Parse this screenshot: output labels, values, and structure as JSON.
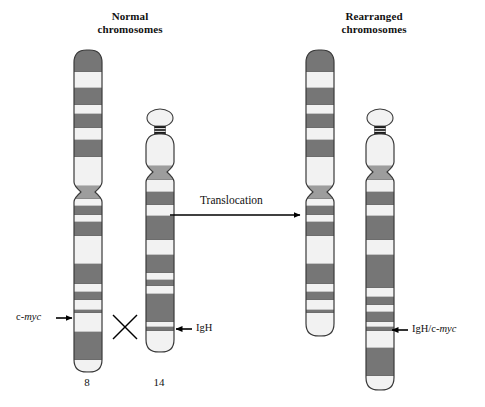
{
  "figure": {
    "kind": "chromosome-translocation-diagram",
    "background": "#ffffff",
    "width": 485,
    "height": 407
  },
  "titles": {
    "normal": "Normal\nchromosomes",
    "rearranged": "Rearranged\nchromosomes"
  },
  "process": {
    "arrow_label": "Translocation",
    "crossing_marker": "X"
  },
  "numbers": {
    "chr8": "8",
    "chr14": "14"
  },
  "labels": {
    "cmyc": {
      "prefix": "c-",
      "italic": "myc",
      "suffix": ""
    },
    "igh": {
      "prefix": "IgH",
      "italic": "",
      "suffix": ""
    },
    "igh_cmyc": {
      "prefix": "IgH/c-",
      "italic": "myc",
      "suffix": ""
    }
  },
  "colors": {
    "band_dark": "#767676",
    "band_mid": "#9d9d9d",
    "band_light": "#f2f2f2",
    "band_black": "#1a1a1a",
    "outline": "#3a3a3a",
    "text": "#111111",
    "arrow": "#000000",
    "background": "#ffffff"
  },
  "chromosomes": [
    {
      "id": "normal-chr8",
      "name": "normal chromosome 8",
      "group": "normal",
      "number": "8",
      "x": 74,
      "width": 28,
      "top": 50,
      "bottom": 372,
      "centromere_y": 192,
      "centromere_pinch": 7,
      "bands": [
        {
          "y0": 50,
          "y1": 72,
          "tone": "dark"
        },
        {
          "y0": 72,
          "y1": 88,
          "tone": "light"
        },
        {
          "y0": 88,
          "y1": 105,
          "tone": "dark"
        },
        {
          "y0": 105,
          "y1": 114,
          "tone": "light"
        },
        {
          "y0": 114,
          "y1": 128,
          "tone": "dark"
        },
        {
          "y0": 128,
          "y1": 140,
          "tone": "light"
        },
        {
          "y0": 140,
          "y1": 157,
          "tone": "dark"
        },
        {
          "y0": 157,
          "y1": 186,
          "tone": "light"
        },
        {
          "y0": 186,
          "y1": 199,
          "tone": "mid"
        },
        {
          "y0": 199,
          "y1": 206,
          "tone": "light"
        },
        {
          "y0": 206,
          "y1": 215,
          "tone": "dark"
        },
        {
          "y0": 215,
          "y1": 222,
          "tone": "light"
        },
        {
          "y0": 222,
          "y1": 236,
          "tone": "dark"
        },
        {
          "y0": 236,
          "y1": 264,
          "tone": "light"
        },
        {
          "y0": 264,
          "y1": 284,
          "tone": "dark"
        },
        {
          "y0": 284,
          "y1": 292,
          "tone": "light"
        },
        {
          "y0": 292,
          "y1": 300,
          "tone": "dark"
        },
        {
          "y0": 300,
          "y1": 310,
          "tone": "light"
        },
        {
          "y0": 310,
          "y1": 313,
          "tone": "dark"
        },
        {
          "y0": 313,
          "y1": 332,
          "tone": "light"
        },
        {
          "y0": 332,
          "y1": 360,
          "tone": "dark"
        },
        {
          "y0": 360,
          "y1": 372,
          "tone": "light"
        }
      ]
    },
    {
      "id": "normal-chr14",
      "name": "normal chromosome 14",
      "group": "normal",
      "number": "14",
      "x": 146,
      "width": 28,
      "top": 134,
      "bottom": 352,
      "satellite": {
        "cy": 118,
        "rx": 13,
        "ry": 9
      },
      "stalk": {
        "y0": 126,
        "y1": 134
      },
      "centromere_y": 172,
      "centromere_pinch": 7,
      "bands": [
        {
          "y0": 134,
          "y1": 166,
          "tone": "light"
        },
        {
          "y0": 166,
          "y1": 180,
          "tone": "mid"
        },
        {
          "y0": 180,
          "y1": 192,
          "tone": "light"
        },
        {
          "y0": 192,
          "y1": 205,
          "tone": "dark"
        },
        {
          "y0": 205,
          "y1": 216,
          "tone": "light"
        },
        {
          "y0": 216,
          "y1": 240,
          "tone": "dark"
        },
        {
          "y0": 240,
          "y1": 255,
          "tone": "light"
        },
        {
          "y0": 255,
          "y1": 273,
          "tone": "dark"
        },
        {
          "y0": 273,
          "y1": 280,
          "tone": "light"
        },
        {
          "y0": 280,
          "y1": 286,
          "tone": "dark"
        },
        {
          "y0": 286,
          "y1": 294,
          "tone": "light"
        },
        {
          "y0": 294,
          "y1": 322,
          "tone": "dark"
        },
        {
          "y0": 322,
          "y1": 327,
          "tone": "light"
        },
        {
          "y0": 327,
          "y1": 331,
          "tone": "dark"
        },
        {
          "y0": 331,
          "y1": 352,
          "tone": "light"
        }
      ]
    },
    {
      "id": "rearranged-chr8",
      "name": "rearranged chromosome 8",
      "group": "rearranged",
      "number": "",
      "x": 306,
      "width": 28,
      "top": 50,
      "bottom": 336,
      "centromere_y": 192,
      "centromere_pinch": 7,
      "bands": [
        {
          "y0": 50,
          "y1": 72,
          "tone": "dark"
        },
        {
          "y0": 72,
          "y1": 88,
          "tone": "light"
        },
        {
          "y0": 88,
          "y1": 105,
          "tone": "dark"
        },
        {
          "y0": 105,
          "y1": 114,
          "tone": "light"
        },
        {
          "y0": 114,
          "y1": 128,
          "tone": "dark"
        },
        {
          "y0": 128,
          "y1": 140,
          "tone": "light"
        },
        {
          "y0": 140,
          "y1": 157,
          "tone": "dark"
        },
        {
          "y0": 157,
          "y1": 186,
          "tone": "light"
        },
        {
          "y0": 186,
          "y1": 199,
          "tone": "mid"
        },
        {
          "y0": 199,
          "y1": 206,
          "tone": "light"
        },
        {
          "y0": 206,
          "y1": 215,
          "tone": "dark"
        },
        {
          "y0": 215,
          "y1": 222,
          "tone": "light"
        },
        {
          "y0": 222,
          "y1": 236,
          "tone": "dark"
        },
        {
          "y0": 236,
          "y1": 264,
          "tone": "light"
        },
        {
          "y0": 264,
          "y1": 284,
          "tone": "dark"
        },
        {
          "y0": 284,
          "y1": 292,
          "tone": "light"
        },
        {
          "y0": 292,
          "y1": 300,
          "tone": "dark"
        },
        {
          "y0": 300,
          "y1": 310,
          "tone": "light"
        },
        {
          "y0": 310,
          "y1": 313,
          "tone": "dark"
        },
        {
          "y0": 313,
          "y1": 336,
          "tone": "light"
        }
      ]
    },
    {
      "id": "rearranged-chr14",
      "name": "rearranged chromosome 14",
      "group": "rearranged",
      "number": "",
      "x": 366,
      "width": 28,
      "top": 134,
      "bottom": 390,
      "satellite": {
        "cy": 118,
        "rx": 13,
        "ry": 9
      },
      "stalk": {
        "y0": 126,
        "y1": 134
      },
      "centromere_y": 172,
      "centromere_pinch": 7,
      "bands": [
        {
          "y0": 134,
          "y1": 166,
          "tone": "light"
        },
        {
          "y0": 166,
          "y1": 180,
          "tone": "mid"
        },
        {
          "y0": 180,
          "y1": 192,
          "tone": "light"
        },
        {
          "y0": 192,
          "y1": 205,
          "tone": "dark"
        },
        {
          "y0": 205,
          "y1": 216,
          "tone": "light"
        },
        {
          "y0": 216,
          "y1": 240,
          "tone": "dark"
        },
        {
          "y0": 240,
          "y1": 255,
          "tone": "light"
        },
        {
          "y0": 255,
          "y1": 288,
          "tone": "dark"
        },
        {
          "y0": 288,
          "y1": 297,
          "tone": "light"
        },
        {
          "y0": 297,
          "y1": 305,
          "tone": "dark"
        },
        {
          "y0": 305,
          "y1": 312,
          "tone": "light"
        },
        {
          "y0": 312,
          "y1": 322,
          "tone": "dark"
        },
        {
          "y0": 322,
          "y1": 327,
          "tone": "light"
        },
        {
          "y0": 327,
          "y1": 331,
          "tone": "dark"
        },
        {
          "y0": 331,
          "y1": 348,
          "tone": "light"
        },
        {
          "y0": 348,
          "y1": 376,
          "tone": "dark"
        },
        {
          "y0": 376,
          "y1": 390,
          "tone": "light"
        }
      ]
    }
  ],
  "annotations": {
    "cmyc_arrow": {
      "x0": 56,
      "x1": 72,
      "y": 318
    },
    "igh_arrow": {
      "x0": 192,
      "x1": 176,
      "y": 329
    },
    "igh_cmyc_arrow": {
      "x0": 408,
      "x1": 392,
      "y": 330
    },
    "translocation_arrow": {
      "x0": 170,
      "x1": 300,
      "y": 215
    },
    "cross_marker": {
      "cx": 125,
      "cy": 327,
      "size": 12
    }
  }
}
